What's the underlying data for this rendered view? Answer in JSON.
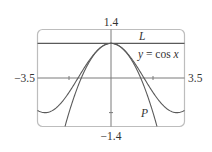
{
  "chart_data": {
    "type": "line",
    "title": "",
    "xlabel": "",
    "ylabel": "",
    "xlim": [
      -3.5,
      3.5
    ],
    "ylim": [
      -1.4,
      1.4
    ],
    "grid": false,
    "legend": "none (inline curve labels)",
    "tick_labels": {
      "x_min": "−3.5",
      "x_max": "3.5",
      "y_max": "1.4",
      "y_min": "−1.4"
    },
    "x_ticks": [
      -2,
      2
    ],
    "y_ticks": [
      -1,
      1
    ],
    "series": [
      {
        "name": "y = cos x",
        "label": "y = cos x",
        "function": "cos(x)",
        "x": [
          -3.5,
          -3.0,
          -2.5,
          -2.0,
          -1.5,
          -1.0,
          -0.5,
          0.0,
          0.5,
          1.0,
          1.5,
          2.0,
          2.5,
          3.0,
          3.5
        ],
        "values": [
          -0.936,
          -0.99,
          -0.801,
          -0.416,
          0.071,
          0.54,
          0.878,
          1.0,
          0.878,
          0.54,
          0.071,
          -0.416,
          -0.801,
          -0.99,
          -0.936
        ]
      },
      {
        "name": "P",
        "label": "P",
        "function": "1 - x^2/2",
        "x": [
          -2.19,
          -2.0,
          -1.5,
          -1.0,
          -0.5,
          0.0,
          0.5,
          1.0,
          1.5,
          2.0,
          2.19
        ],
        "values": [
          -1.4,
          -1.0,
          -0.125,
          0.5,
          0.875,
          1.0,
          0.875,
          0.5,
          -0.125,
          -1.0,
          -1.4
        ]
      },
      {
        "name": "L",
        "label": "L",
        "function": "1",
        "x": [
          -3.5,
          3.5
        ],
        "values": [
          1.0,
          1.0
        ]
      }
    ],
    "annotations": [
      "L",
      "y = cos x",
      "P"
    ]
  },
  "labels": {
    "y_top": "1.4",
    "y_bottom": "−1.4",
    "x_left": "−3.5",
    "x_right": "3.5",
    "curve_L": "L",
    "curve_cos_y": "y",
    "curve_cos_eq": " = cos ",
    "curve_cos_x": "x",
    "curve_P": "P"
  },
  "colors": {
    "frame": "#bdbdbd",
    "axes": "#7a7a7a",
    "curves": "#5a5a5a",
    "text": "#333333"
  }
}
